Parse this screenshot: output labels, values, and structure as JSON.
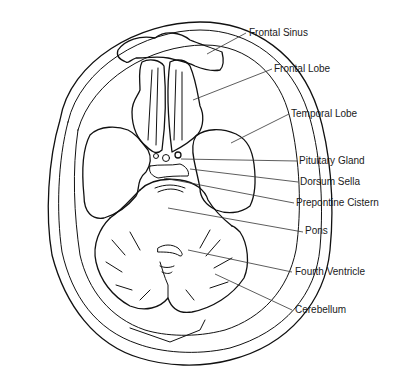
{
  "diagram": {
    "type": "anatomical-line-drawing",
    "stroke_color": "#111111",
    "background_color": "#ffffff",
    "labels": [
      {
        "id": "frontal-sinus",
        "text": "Frontal Sinus",
        "x": 249,
        "y": 27,
        "lx1": 246,
        "ly1": 33,
        "lx2": 207,
        "ly2": 54
      },
      {
        "id": "frontal-lobe",
        "text": "Frontal Lobe",
        "x": 274,
        "y": 63,
        "lx1": 272,
        "ly1": 69,
        "lx2": 193,
        "ly2": 100
      },
      {
        "id": "temporal-lobe",
        "text": "Temporal Lobe",
        "x": 291,
        "y": 108,
        "lx1": 289,
        "ly1": 114,
        "lx2": 231,
        "ly2": 143
      },
      {
        "id": "pituitary-gland",
        "text": "Pituitary Gland",
        "x": 299,
        "y": 155,
        "lx1": 297,
        "ly1": 161,
        "lx2": 181,
        "ly2": 159
      },
      {
        "id": "dorsum-sella",
        "text": "Dorsum Sella",
        "x": 300,
        "y": 176,
        "lx1": 298,
        "ly1": 182,
        "lx2": 190,
        "ly2": 169
      },
      {
        "id": "prepontine-cistern",
        "text": "Prepontine Cistern",
        "x": 296,
        "y": 197,
        "lx1": 294,
        "ly1": 203,
        "lx2": 164,
        "ly2": 178
      },
      {
        "id": "pons",
        "text": "Pons",
        "x": 305,
        "y": 225,
        "lx1": 303,
        "ly1": 232,
        "lx2": 168,
        "ly2": 208
      },
      {
        "id": "fourth-ventricle",
        "text": "Fourth Ventricle",
        "x": 295,
        "y": 266,
        "lx1": 292,
        "ly1": 272,
        "lx2": 188,
        "ly2": 250
      },
      {
        "id": "cerebellum",
        "text": "Cerebellum",
        "x": 295,
        "y": 304,
        "lx1": 292,
        "ly1": 310,
        "lx2": 215,
        "ly2": 274
      }
    ]
  }
}
